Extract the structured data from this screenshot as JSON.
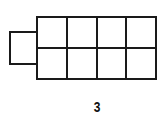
{
  "figure": {
    "label": "3",
    "stroke_color": "#1a1a1a",
    "background": "#ffffff",
    "grid": {
      "columns": 4,
      "rows": 2
    },
    "tab": {
      "side": "left",
      "count": 1
    }
  }
}
